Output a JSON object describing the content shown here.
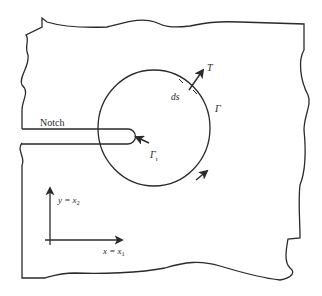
{
  "figure": {
    "type": "J-integral contour around notch tip",
    "labels": {
      "notch": "Notch",
      "traction": "T",
      "arc_length": "ds",
      "contour": "Γ",
      "tip_contour": "Γ",
      "tip_contour_sub": "t",
      "y_axis": "y = x",
      "y_axis_sub": "2",
      "x_axis": "x = x",
      "x_axis_sub": "1"
    },
    "colors": {
      "stroke": "#2a2a2a",
      "background": "#ffffff"
    }
  }
}
